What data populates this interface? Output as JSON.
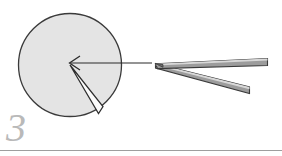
{
  "figure": {
    "step_label": "3",
    "caption": "",
    "colors": {
      "background": "#ffffff",
      "specimen_fill": "#e4e4e4",
      "specimen_stroke": "#3a3a3a",
      "wedge_fill": "#ffffff",
      "wedge_stroke": "#2e2e2e",
      "arrow_stroke": "#2b2b2b",
      "tool_face_light": "#d8d8d8",
      "tool_face_mid": "#9c9c9c",
      "tool_face_dark": "#7e7e7e",
      "tool_stroke": "#3a3a3a",
      "step_number_color": "#b9b9b9",
      "rule_color": "#9e9e9e"
    },
    "specimen": {
      "name": "circular-specimen",
      "center_x": 70,
      "center_y": 65,
      "radius": 52
    },
    "wedge": {
      "name": "wedge-cut",
      "apex_x": 70,
      "apex_y": 65,
      "edge1_x": 98,
      "edge1_y": 113,
      "edge2_x": 103,
      "edge2_y": 106
    },
    "arrow": {
      "name": "direction-arrow",
      "from_x": 152,
      "from_y": 63,
      "to_x": 70,
      "to_y": 63,
      "head_size": 9
    },
    "tool": {
      "name": "tweezers",
      "tip_x": 155,
      "tip_y": 63,
      "upper_arm_end_x": 268,
      "upper_arm_end_y": 62,
      "lower_arm_end_x": 250,
      "lower_arm_end_y": 92,
      "arm_thickness": 6
    },
    "rule": {
      "name": "bottom-rule",
      "y": 150,
      "x_start": 0,
      "x_end": 282,
      "thickness": 1
    }
  }
}
